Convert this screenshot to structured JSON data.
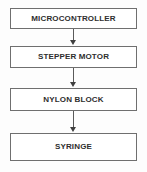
{
  "diagram": {
    "type": "flowchart",
    "orientation": "vertical",
    "title": "",
    "nodes": [
      {
        "id": "microcontroller",
        "label": "MICROCONTROLLER"
      },
      {
        "id": "stepper-motor",
        "label": "STEPPER MOTOR"
      },
      {
        "id": "nylon-block",
        "label": "NYLON BLOCK"
      },
      {
        "id": "syringe",
        "label": "SYRINGE"
      }
    ],
    "edges": [
      {
        "from": "microcontroller",
        "to": "stepper-motor",
        "label": ""
      },
      {
        "from": "stepper-motor",
        "to": "nylon-block",
        "label": ""
      },
      {
        "from": "nylon-block",
        "to": "syringe",
        "label": ""
      }
    ],
    "colors": {
      "background": "#fdfdfd",
      "node_fill": "#ffffff",
      "node_border": "#6f6f6f",
      "text": "#2e2e2e",
      "arrow": "#3f3f3f"
    }
  }
}
